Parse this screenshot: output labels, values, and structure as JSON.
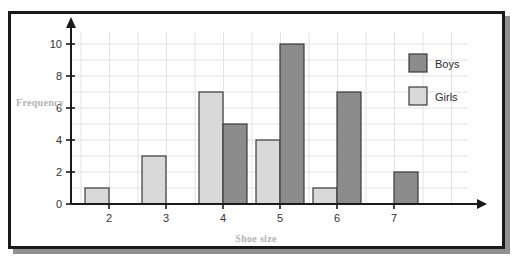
{
  "chart_data": {
    "type": "bar",
    "title": "",
    "xlabel": "Shoe size",
    "ylabel": "Frequency",
    "categories": [
      "2",
      "3",
      "4",
      "5",
      "6",
      "7"
    ],
    "series": [
      {
        "name": "Girls",
        "values": [
          1,
          3,
          7,
          4,
          1,
          0
        ],
        "color": "#d9d9d9"
      },
      {
        "name": "Boys",
        "values": [
          0,
          0,
          5,
          10,
          7,
          2
        ],
        "color": "#8c8c8c"
      }
    ],
    "ylim": [
      0,
      10
    ],
    "yticks": [
      0,
      2,
      4,
      6,
      8,
      10
    ],
    "ytick_labels": [
      "0",
      "2",
      "4",
      "6",
      "8",
      "10"
    ],
    "xtick_labels": [
      "2",
      "3",
      "4",
      "5",
      "6",
      "7"
    ],
    "grid": true,
    "grid_color": "#e3e3e3",
    "legend_position": "top-right",
    "legend": [
      "Boys",
      "Girls"
    ],
    "axis_color": "#1a1a1a",
    "axis_arrows": true
  },
  "axes": {
    "y_title": "Frequency",
    "x_title": "Shoe size"
  },
  "legend": {
    "entries": [
      {
        "label": "Boys",
        "color": "#8c8c8c"
      },
      {
        "label": "Girls",
        "color": "#d9d9d9"
      }
    ]
  }
}
